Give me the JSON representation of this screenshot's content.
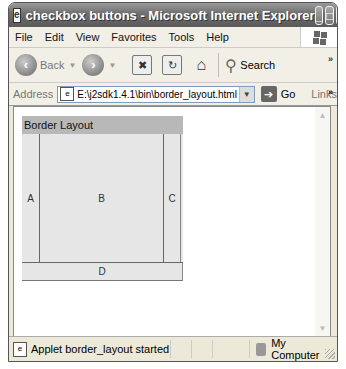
{
  "window": {
    "title": "checkbox buttons - Microsoft Internet Explorer",
    "controls": {
      "minimize": "_",
      "maximize": "□",
      "close": "✕"
    }
  },
  "menubar": {
    "items": [
      "File",
      "Edit",
      "View",
      "Favorites",
      "Tools",
      "Help"
    ]
  },
  "toolbar": {
    "back_label": "Back",
    "forward_label": "",
    "stop_glyph": "✖",
    "refresh_glyph": "↻",
    "home_glyph": "⌂",
    "search_label": "Search",
    "search_glyph": "⚲",
    "more_glyph": "»"
  },
  "address": {
    "label": "Address",
    "value": "E:\\j2sdk1.4.1\\bin\\border_layout.html",
    "go_label": "Go",
    "links_label": "Links",
    "more_glyph": "»"
  },
  "applet": {
    "title": "Border Layout",
    "regions": {
      "west": "A",
      "center": "B",
      "east": "C",
      "south": "D"
    },
    "colors": {
      "header_bg": "#b8b8b8",
      "panel_bg": "#e6e6e6"
    }
  },
  "statusbar": {
    "message": "Applet border_layout started",
    "zone": "My Computer"
  }
}
